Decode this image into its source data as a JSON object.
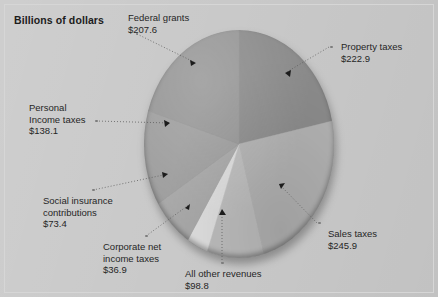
{
  "title": "Billions of dollars",
  "background_color": "#c9c9c9",
  "chart_data": {
    "type": "pie",
    "title": "Billions of dollars",
    "units": "Billions of dollars",
    "total": 1023.6,
    "legend": "callout-labels",
    "categories": [
      "Property taxes",
      "Sales taxes",
      "All other revenues",
      "Corporate net income taxes",
      "Social insurance contributions",
      "Personal Income taxes",
      "Federal grants"
    ],
    "values": [
      222.9,
      245.9,
      98.8,
      36.9,
      73.4,
      138.1,
      207.6
    ],
    "value_labels": [
      "$222.9",
      "$245.9",
      "$98.8",
      "$36.9",
      "$73.4",
      "$138.1",
      "$207.6"
    ],
    "colors": [
      "#8b8b8b",
      "#b2b2b2",
      "#bdbdbd",
      "#dedede",
      "#a8a8a8",
      "#9e9e9e",
      "#969696"
    ],
    "slices": [
      {
        "name": "Property taxes",
        "label": "Property taxes",
        "value": 222.9,
        "value_label": "$222.9",
        "color": "#8b8b8b",
        "start_angle": 0,
        "end_angle": 78.4
      },
      {
        "name": "Sales taxes",
        "label": "Sales taxes",
        "value": 245.9,
        "value_label": "$245.9",
        "color": "#b2b2b2",
        "start_angle": 78.4,
        "end_angle": 164.9
      },
      {
        "name": "All other revenues",
        "label": "All other revenues",
        "value": 98.8,
        "value_label": "$98.8",
        "color": "#bdbdbd",
        "start_angle": 164.9,
        "end_angle": 199.6
      },
      {
        "name": "Corporate net income taxes",
        "label": "Corporate net income taxes",
        "label_line1": "Corporate net",
        "label_line2": "income taxes",
        "value": 36.9,
        "value_label": "$36.9",
        "color": "#dedede",
        "start_angle": 199.6,
        "end_angle": 212.6
      },
      {
        "name": "Social insurance contributions",
        "label": "Social insurance contributions",
        "label_line1": "Social insurance",
        "label_line2": "contributions",
        "value": 73.4,
        "value_label": "$73.4",
        "color": "#a8a8a8",
        "start_angle": 212.6,
        "end_angle": 238.4
      },
      {
        "name": "Personal Income taxes",
        "label": "Personal Income taxes",
        "label_line1": "Personal",
        "label_line2": "Income taxes",
        "value": 138.1,
        "value_label": "$138.1",
        "color": "#9e9e9e",
        "start_angle": 238.4,
        "end_angle": 286.9
      },
      {
        "name": "Federal grants",
        "label": "Federal grants",
        "value": 207.6,
        "value_label": "$207.6",
        "color": "#969696",
        "start_angle": 286.9,
        "end_angle": 360
      }
    ]
  },
  "labels": {
    "federal_grants": {
      "name": "Federal grants",
      "value": "$207.6"
    },
    "property_taxes": {
      "name": "Property taxes",
      "value": "$222.9"
    },
    "sales_taxes": {
      "name": "Sales taxes",
      "value": "$245.9"
    },
    "all_other_revenues": {
      "name": "All other revenues",
      "value": "$98.8"
    },
    "corporate_net_income_taxes": {
      "line1": "Corporate net",
      "line2": "income taxes",
      "value": "$36.9"
    },
    "social_insurance": {
      "line1": "Social insurance",
      "line2": "contributions",
      "value": "$73.4"
    },
    "personal_income_taxes": {
      "line1": "Personal",
      "line2": "Income taxes",
      "value": "$138.1"
    }
  }
}
